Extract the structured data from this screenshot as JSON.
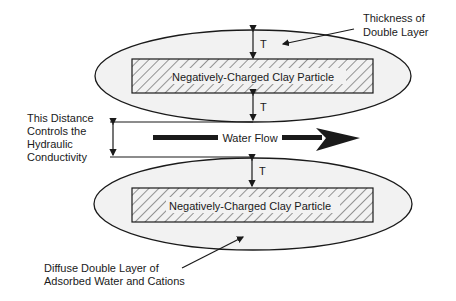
{
  "diagram": {
    "particles": [
      {
        "label": "Negatively-Charged Clay Particle"
      },
      {
        "label": "Negatively-Charged Clay Particle"
      }
    ],
    "thickness_marker": "T",
    "water_flow_label": "Water Flow",
    "annotations": {
      "thickness": [
        "Thickness of",
        "Double Layer"
      ],
      "distance": [
        "This Distance",
        "Controls the",
        "Hydraulic",
        "Conductivity"
      ],
      "diffuse": [
        "Diffuse Double Layer of",
        "Adsorbed Water and Cations"
      ]
    },
    "colors": {
      "ellipse_fill": "#f2f2f2",
      "stroke": "#1a1a1a"
    }
  }
}
